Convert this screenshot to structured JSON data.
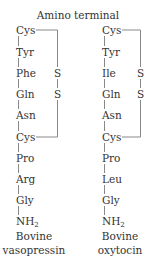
{
  "title": "Amino terminal",
  "chains": [
    {
      "name": "vasopressin",
      "residues": [
        "Cys",
        "Tyr",
        "Phe",
        "Gln",
        "Asn",
        "Cys",
        "Pro",
        "Arg",
        "Gly",
        "NH"
      ],
      "terminal_subscript": "2",
      "disulfide": [
        "S",
        "S"
      ],
      "caption_line1": "Bovine",
      "caption_line2": "vasopressin"
    },
    {
      "name": "oxytocin",
      "residues": [
        "Cys",
        "Tyr",
        "Ile",
        "Gln",
        "Asn",
        "Cys",
        "Pro",
        "Leu",
        "Gly",
        "NH"
      ],
      "terminal_subscript": "2",
      "disulfide": [
        "S",
        "S"
      ],
      "caption_line1": "Bovine",
      "caption_line2": "oxytocin"
    }
  ]
}
